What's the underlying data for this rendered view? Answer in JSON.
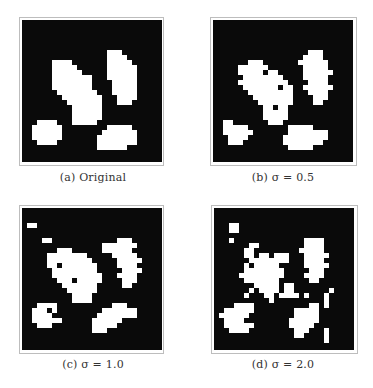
{
  "figure": {
    "grid_size": 28,
    "cell_px": 5,
    "colors": {
      "background": "#0a0a0a",
      "foreground": "#ffffff",
      "frame": "#bdbdbd",
      "caption": "#333333"
    },
    "panels": [
      {
        "id": "a",
        "caption": "(a) Original",
        "rows": [
          [
            6,
            17,
            19
          ],
          [
            7,
            17,
            20
          ],
          [
            8,
            17,
            21
          ],
          [
            9,
            17,
            22
          ],
          [
            10,
            17,
            22
          ],
          [
            11,
            17,
            22
          ],
          [
            12,
            18,
            22
          ],
          [
            13,
            18,
            22
          ],
          [
            14,
            18,
            22
          ],
          [
            15,
            19,
            22
          ],
          [
            16,
            19,
            21
          ],
          [
            8,
            6,
            9
          ],
          [
            9,
            6,
            10
          ],
          [
            10,
            6,
            10
          ],
          [
            11,
            6,
            12
          ],
          [
            12,
            6,
            13
          ],
          [
            13,
            6,
            13
          ],
          [
            14,
            7,
            14
          ],
          [
            15,
            8,
            15
          ],
          [
            16,
            9,
            15
          ],
          [
            17,
            10,
            15
          ],
          [
            18,
            10,
            15
          ],
          [
            19,
            10,
            15
          ],
          [
            20,
            10,
            14
          ],
          [
            10,
            10,
            11
          ],
          [
            11,
            10,
            13
          ],
          [
            20,
            3,
            6
          ],
          [
            21,
            2,
            7
          ],
          [
            22,
            2,
            7
          ],
          [
            23,
            2,
            7
          ],
          [
            24,
            3,
            6
          ],
          [
            21,
            17,
            21
          ],
          [
            22,
            16,
            22
          ],
          [
            23,
            15,
            22
          ],
          [
            24,
            15,
            22
          ],
          [
            25,
            15,
            20
          ]
        ]
      },
      {
        "id": "b",
        "caption": "(b) σ = 0.5",
        "rows": [
          [
            6,
            19,
            21
          ],
          [
            7,
            18,
            21
          ],
          [
            8,
            17,
            22
          ],
          [
            9,
            18,
            22
          ],
          [
            10,
            18,
            23
          ],
          [
            11,
            18,
            22
          ],
          [
            12,
            19,
            22
          ],
          [
            13,
            18,
            23
          ],
          [
            14,
            19,
            22
          ],
          [
            15,
            20,
            22
          ],
          [
            16,
            20,
            21
          ],
          [
            8,
            7,
            9
          ],
          [
            9,
            5,
            10
          ],
          [
            10,
            5,
            12
          ],
          [
            11,
            6,
            13
          ],
          [
            12,
            5,
            14
          ],
          [
            13,
            6,
            15
          ],
          [
            14,
            7,
            15
          ],
          [
            15,
            8,
            15
          ],
          [
            16,
            9,
            15
          ],
          [
            17,
            10,
            14
          ],
          [
            18,
            10,
            14
          ],
          [
            19,
            10,
            14
          ],
          [
            20,
            11,
            13
          ],
          [
            20,
            2,
            3
          ],
          [
            21,
            2,
            6
          ],
          [
            22,
            2,
            7
          ],
          [
            23,
            3,
            6
          ],
          [
            24,
            3,
            5
          ],
          [
            21,
            15,
            19
          ],
          [
            22,
            15,
            22
          ],
          [
            23,
            14,
            22
          ],
          [
            24,
            14,
            21
          ],
          [
            25,
            15,
            19
          ]
        ],
        "holes": [
          [
            10,
            10
          ],
          [
            13,
            13
          ],
          [
            17,
            12
          ]
        ]
      },
      {
        "id": "c",
        "caption": "(c) σ = 1.0",
        "rows": [
          [
            3,
            1,
            2
          ],
          [
            6,
            4,
            5
          ],
          [
            6,
            19,
            21
          ],
          [
            7,
            18,
            22
          ],
          [
            8,
            18,
            21
          ],
          [
            9,
            18,
            22
          ],
          [
            10,
            19,
            23
          ],
          [
            11,
            19,
            22
          ],
          [
            12,
            20,
            23
          ],
          [
            13,
            19,
            22
          ],
          [
            14,
            20,
            22
          ],
          [
            15,
            20,
            21
          ],
          [
            7,
            16,
            17
          ],
          [
            8,
            16,
            17
          ],
          [
            8,
            7,
            9
          ],
          [
            9,
            5,
            12
          ],
          [
            10,
            5,
            13
          ],
          [
            11,
            5,
            14
          ],
          [
            12,
            6,
            14
          ],
          [
            13,
            6,
            15
          ],
          [
            14,
            7,
            15
          ],
          [
            15,
            8,
            14
          ],
          [
            16,
            9,
            14
          ],
          [
            17,
            10,
            13
          ],
          [
            18,
            10,
            13
          ],
          [
            19,
            3,
            6
          ],
          [
            20,
            2,
            6
          ],
          [
            21,
            2,
            5
          ],
          [
            22,
            2,
            7
          ],
          [
            23,
            3,
            5
          ],
          [
            20,
            21,
            22
          ],
          [
            21,
            21,
            22
          ],
          [
            19,
            18,
            20
          ],
          [
            20,
            16,
            20
          ],
          [
            21,
            15,
            20
          ],
          [
            22,
            14,
            19
          ],
          [
            23,
            14,
            18
          ],
          [
            24,
            14,
            16
          ]
        ],
        "holes": [
          [
            11,
            7
          ],
          [
            14,
            10
          ],
          [
            20,
            5
          ]
        ]
      },
      {
        "id": "d",
        "caption": "(d) σ = 2.0",
        "rows": [
          [
            3,
            3,
            4
          ],
          [
            4,
            3,
            4
          ],
          [
            6,
            3,
            3
          ],
          [
            7,
            7,
            8
          ],
          [
            8,
            6,
            7
          ],
          [
            9,
            6,
            10
          ],
          [
            10,
            7,
            14
          ],
          [
            11,
            6,
            12
          ],
          [
            12,
            6,
            13
          ],
          [
            13,
            5,
            13
          ],
          [
            14,
            6,
            12
          ],
          [
            15,
            8,
            12
          ],
          [
            16,
            9,
            12
          ],
          [
            17,
            10,
            11
          ],
          [
            18,
            11,
            11
          ],
          [
            9,
            12,
            14
          ],
          [
            10,
            12,
            14
          ],
          [
            6,
            18,
            21
          ],
          [
            7,
            18,
            21
          ],
          [
            8,
            17,
            21
          ],
          [
            9,
            18,
            22
          ],
          [
            10,
            18,
            21
          ],
          [
            11,
            18,
            22
          ],
          [
            12,
            19,
            21
          ],
          [
            13,
            18,
            21
          ],
          [
            14,
            19,
            20
          ],
          [
            15,
            14,
            15
          ],
          [
            16,
            14,
            15
          ],
          [
            17,
            14,
            15
          ],
          [
            16,
            7,
            7
          ],
          [
            17,
            6,
            6
          ],
          [
            17,
            13,
            13
          ],
          [
            17,
            16,
            16
          ],
          [
            17,
            18,
            18
          ],
          [
            16,
            23,
            23
          ],
          [
            17,
            22,
            22
          ],
          [
            18,
            22,
            22
          ],
          [
            19,
            22,
            22
          ],
          [
            19,
            4,
            7
          ],
          [
            20,
            2,
            7
          ],
          [
            21,
            1,
            6
          ],
          [
            22,
            2,
            5
          ],
          [
            23,
            2,
            7
          ],
          [
            24,
            3,
            6
          ],
          [
            19,
            19,
            20
          ],
          [
            20,
            16,
            20
          ],
          [
            21,
            16,
            20
          ],
          [
            22,
            15,
            20
          ],
          [
            23,
            15,
            19
          ],
          [
            24,
            16,
            18
          ],
          [
            25,
            16,
            17
          ],
          [
            24,
            22,
            22
          ],
          [
            25,
            22,
            22
          ],
          [
            26,
            22,
            22
          ]
        ],
        "holes": [
          [
            9,
            8
          ],
          [
            11,
            7
          ]
        ]
      }
    ]
  }
}
